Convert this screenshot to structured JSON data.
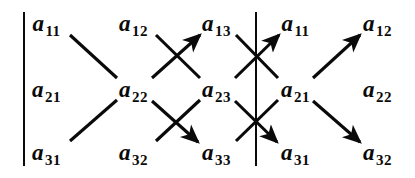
{
  "figure": {
    "width": 415,
    "height": 178,
    "background_color": "#ffffff",
    "ink_color": "#0a0a0a"
  },
  "bars": [
    {
      "name": "left-matrix-bar",
      "x": 23,
      "y_top": 12,
      "y_bottom": 166
    },
    {
      "name": "middle-matrix-bar",
      "x": 255,
      "y_top": 12,
      "y_bottom": 166
    }
  ],
  "grid": {
    "column_x": [
      46,
      133,
      216,
      295,
      377
    ],
    "row_y": [
      23,
      89,
      152
    ]
  },
  "entries": [
    {
      "id": "r1c1",
      "base": "a",
      "sub": "11",
      "x": 46,
      "y": 23,
      "row": 1,
      "col": 1
    },
    {
      "id": "r1c2",
      "base": "a",
      "sub": "12",
      "x": 133,
      "y": 23,
      "row": 1,
      "col": 2
    },
    {
      "id": "r1c3",
      "base": "a",
      "sub": "13",
      "x": 216,
      "y": 23,
      "row": 1,
      "col": 3
    },
    {
      "id": "r1c4",
      "base": "a",
      "sub": "11",
      "x": 295,
      "y": 23,
      "row": 1,
      "col": 4
    },
    {
      "id": "r1c5",
      "base": "a",
      "sub": "12",
      "x": 377,
      "y": 23,
      "row": 1,
      "col": 5
    },
    {
      "id": "r2c1",
      "base": "a",
      "sub": "21",
      "x": 46,
      "y": 89,
      "row": 2,
      "col": 1
    },
    {
      "id": "r2c2",
      "base": "a",
      "sub": "22",
      "x": 133,
      "y": 89,
      "row": 2,
      "col": 2
    },
    {
      "id": "r2c3",
      "base": "a",
      "sub": "23",
      "x": 216,
      "y": 89,
      "row": 2,
      "col": 3
    },
    {
      "id": "r2c4",
      "base": "a",
      "sub": "21",
      "x": 295,
      "y": 89,
      "row": 2,
      "col": 4
    },
    {
      "id": "r2c5",
      "base": "a",
      "sub": "22",
      "x": 377,
      "y": 89,
      "row": 2,
      "col": 5
    },
    {
      "id": "r3c1",
      "base": "a",
      "sub": "31",
      "x": 46,
      "y": 152,
      "row": 3,
      "col": 1
    },
    {
      "id": "r3c2",
      "base": "a",
      "sub": "32",
      "x": 133,
      "y": 152,
      "row": 3,
      "col": 2
    },
    {
      "id": "r3c3",
      "base": "a",
      "sub": "33",
      "x": 216,
      "y": 152,
      "row": 3,
      "col": 3
    },
    {
      "id": "r3c4",
      "base": "a",
      "sub": "31",
      "x": 295,
      "y": 152,
      "row": 3,
      "col": 4
    },
    {
      "id": "r3c5",
      "base": "a",
      "sub": "32",
      "x": 377,
      "y": 152,
      "row": 3,
      "col": 5
    }
  ],
  "connectors": [
    {
      "name": "down-a11-a22",
      "from": "r1c1",
      "to": "r2c2",
      "x1": 70,
      "y1": 35,
      "x2": 117,
      "y2": 78,
      "arrow": false
    },
    {
      "name": "down-a22-a33",
      "from": "r2c2",
      "to": "r3c3",
      "x1": 152,
      "y1": 101,
      "x2": 198,
      "y2": 142,
      "arrow": true
    },
    {
      "name": "down-a12-a23",
      "from": "r1c2",
      "to": "r2c3",
      "x1": 156,
      "y1": 35,
      "x2": 200,
      "y2": 78,
      "arrow": false
    },
    {
      "name": "down-a23-a31",
      "from": "r2c3",
      "to": "r3c4",
      "x1": 235,
      "y1": 101,
      "x2": 277,
      "y2": 142,
      "arrow": true
    },
    {
      "name": "down-a13-a21",
      "from": "r1c3",
      "to": "r2c4",
      "x1": 236,
      "y1": 35,
      "x2": 278,
      "y2": 78,
      "arrow": false
    },
    {
      "name": "down-a21-a32",
      "from": "r2c4",
      "to": "r3c5",
      "x1": 313,
      "y1": 101,
      "x2": 360,
      "y2": 142,
      "arrow": true
    },
    {
      "name": "up-a31-a22",
      "from": "r3c1",
      "to": "r2c2",
      "x1": 70,
      "y1": 141,
      "x2": 117,
      "y2": 100,
      "arrow": false
    },
    {
      "name": "up-a22-a13",
      "from": "r2c2",
      "to": "r1c3",
      "x1": 152,
      "y1": 78,
      "x2": 200,
      "y2": 35,
      "arrow": true
    },
    {
      "name": "up-a32-a23",
      "from": "r3c2",
      "to": "r2c3",
      "x1": 156,
      "y1": 141,
      "x2": 200,
      "y2": 100,
      "arrow": false
    },
    {
      "name": "up-a23-a11",
      "from": "r2c3",
      "to": "r1c4",
      "x1": 235,
      "y1": 78,
      "x2": 279,
      "y2": 35,
      "arrow": true
    },
    {
      "name": "up-a33-a21",
      "from": "r3c3",
      "to": "r2c4",
      "x1": 236,
      "y1": 141,
      "x2": 278,
      "y2": 100,
      "arrow": false
    },
    {
      "name": "up-a21-a12",
      "from": "r2c4",
      "to": "r1c5",
      "x1": 313,
      "y1": 78,
      "x2": 360,
      "y2": 35,
      "arrow": true
    }
  ]
}
